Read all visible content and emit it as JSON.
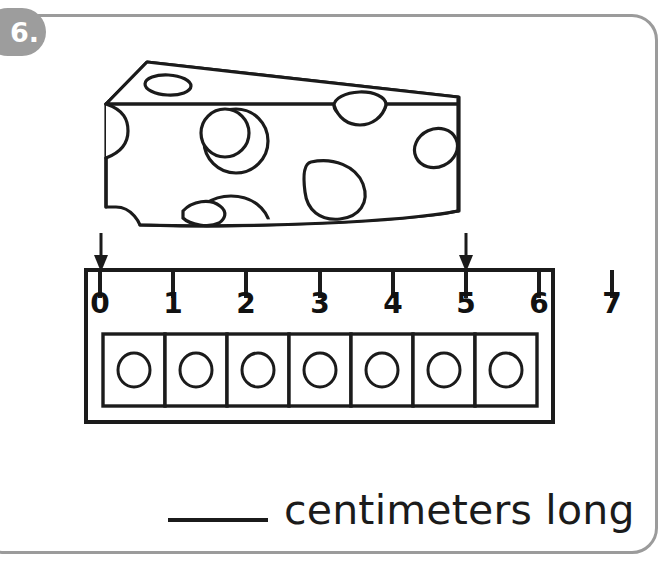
{
  "problem": {
    "number_label": "6.",
    "accent_color": "#9d9d9d",
    "border_color": "#9b9b9b",
    "ink_color": "#1b1b1b"
  },
  "object": {
    "name": "cheese-wedge",
    "description": "wedge of swiss cheese with holes"
  },
  "ruler": {
    "name": "centimeter-ruler",
    "unit": "centimeters",
    "tick_labels": [
      "0",
      "1",
      "2",
      "3",
      "4",
      "5",
      "6",
      "7"
    ],
    "tick_values": [
      0,
      1,
      2,
      3,
      4,
      5,
      6,
      7
    ],
    "cell_count": 7,
    "markers": [
      {
        "name": "left-measure-arrow",
        "value": 0
      },
      {
        "name": "right-measure-arrow",
        "value": 5
      }
    ]
  },
  "answer": {
    "blank": "",
    "label": "centimeters long"
  }
}
